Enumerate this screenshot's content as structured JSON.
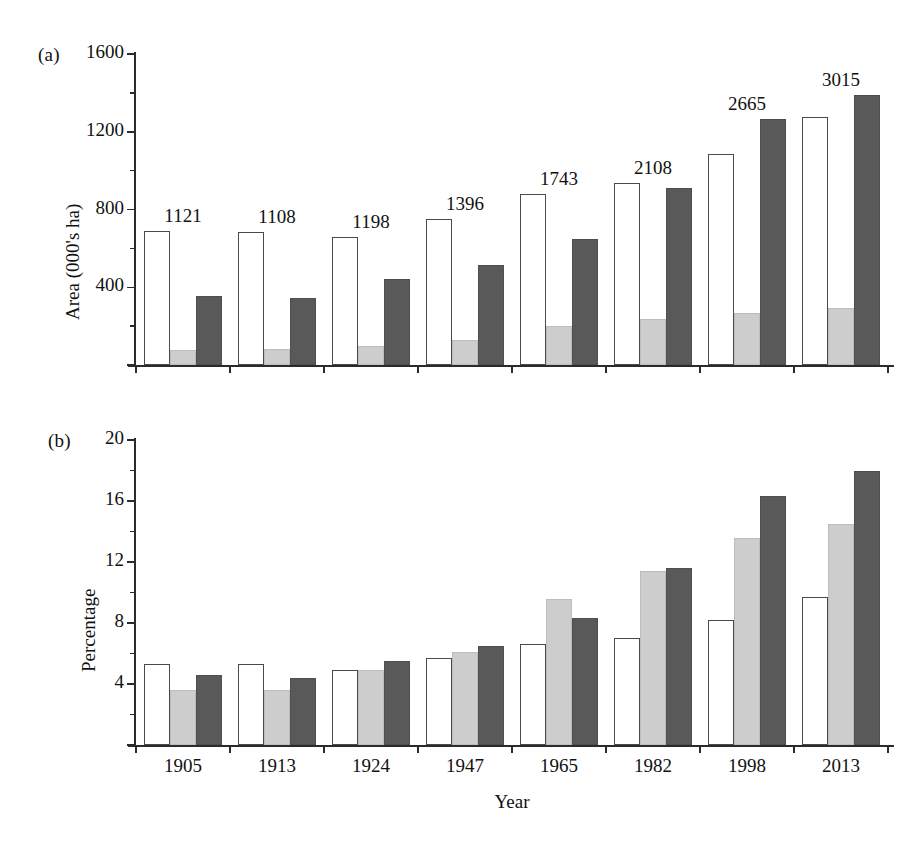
{
  "figure": {
    "panels": [
      {
        "tag": "(a)",
        "ylabel": "Area (000's ha)",
        "xlabel": "",
        "yticks": [
          0,
          400,
          800,
          1200,
          1600
        ],
        "ytick_labels": [
          "",
          "400",
          "800",
          "1200",
          "1600"
        ],
        "yminor_step": 200,
        "ylim": [
          0,
          1600
        ]
      },
      {
        "tag": "(b)",
        "ylabel": "Percentage",
        "xlabel": "Year",
        "yticks": [
          0,
          4,
          8,
          12,
          16,
          20
        ],
        "ytick_labels": [
          "",
          "4",
          "8",
          "12",
          "16",
          "20"
        ],
        "yminor_step": 2,
        "ylim": [
          0,
          20
        ]
      }
    ]
  },
  "chart_data": [
    {
      "type": "bar",
      "panel": "(a)",
      "title": "",
      "xlabel": "",
      "ylabel": "Area (000's ha)",
      "categories": [
        "1905",
        "1913",
        "1924",
        "1947",
        "1965",
        "1982",
        "1998",
        "2013"
      ],
      "series": [
        {
          "name": "series-1-white",
          "fill": "#ffffff",
          "values": [
            690,
            685,
            660,
            750,
            880,
            935,
            1085,
            1275
          ]
        },
        {
          "name": "series-2-light",
          "fill": "#cdcdcd",
          "values": [
            78,
            80,
            98,
            128,
            200,
            235,
            270,
            295
          ]
        },
        {
          "name": "series-3-dark",
          "fill": "#595959",
          "values": [
            355,
            345,
            440,
            515,
            650,
            910,
            1265,
            1390
          ]
        }
      ],
      "bar_totals": [
        "1121",
        "1108",
        "1198",
        "1396",
        "1743",
        "2108",
        "2665",
        "3015"
      ],
      "ylim": [
        0,
        1600
      ],
      "ytick_labels": [
        "400",
        "800",
        "1200",
        "1600"
      ],
      "grid": false,
      "legend": "none"
    },
    {
      "type": "bar",
      "panel": "(b)",
      "title": "",
      "xlabel": "Year",
      "ylabel": "Percentage",
      "categories": [
        "1905",
        "1913",
        "1924",
        "1947",
        "1965",
        "1982",
        "1998",
        "2013"
      ],
      "series": [
        {
          "name": "series-1-white",
          "fill": "#ffffff",
          "values": [
            5.3,
            5.3,
            4.9,
            5.7,
            6.6,
            7.0,
            8.2,
            9.7
          ]
        },
        {
          "name": "series-2-light",
          "fill": "#cdcdcd",
          "values": [
            3.6,
            3.6,
            4.9,
            6.1,
            9.6,
            11.4,
            13.6,
            14.5
          ]
        },
        {
          "name": "series-3-dark",
          "fill": "#595959",
          "values": [
            4.6,
            4.4,
            5.5,
            6.5,
            8.3,
            11.6,
            16.3,
            18.0
          ]
        }
      ],
      "ylim": [
        0,
        20
      ],
      "ytick_labels": [
        "4",
        "8",
        "12",
        "16",
        "20"
      ],
      "grid": false,
      "legend": "none"
    }
  ],
  "colors": {
    "bar_white": "#ffffff",
    "bar_light": "#cdcdcd",
    "bar_dark": "#595959",
    "axis": "#2b2b2b",
    "text": "#111111",
    "background": "#ffffff"
  }
}
